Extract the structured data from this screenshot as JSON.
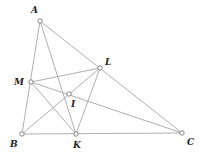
{
  "diagram": {
    "points": {
      "A": {
        "label": "A",
        "x": 40,
        "y": 21,
        "lx": 31,
        "ly": 13
      },
      "B": {
        "label": "B",
        "x": 22,
        "y": 134,
        "lx": 10,
        "ly": 147
      },
      "C": {
        "label": "C",
        "x": 182,
        "y": 133,
        "lx": 187,
        "ly": 145
      },
      "K": {
        "label": "K",
        "x": 76,
        "y": 134,
        "lx": 73,
        "ly": 148
      },
      "L": {
        "label": "L",
        "x": 100,
        "y": 68,
        "lx": 105,
        "ly": 65
      },
      "M": {
        "label": "M",
        "x": 31,
        "y": 82,
        "lx": 14,
        "ly": 85
      },
      "I": {
        "label": "I",
        "x": 69,
        "y": 94,
        "lx": 71,
        "ly": 107
      }
    },
    "segments": [
      [
        "A",
        "B"
      ],
      [
        "A",
        "C"
      ],
      [
        "B",
        "C"
      ],
      [
        "A",
        "K"
      ],
      [
        "B",
        "L"
      ],
      [
        "C",
        "M"
      ],
      [
        "M",
        "L"
      ],
      [
        "M",
        "K"
      ],
      [
        "L",
        "K"
      ]
    ],
    "colors": {
      "line": "#9a9a9a",
      "point_stroke": "#6a6a6a",
      "label": "#222222"
    }
  }
}
